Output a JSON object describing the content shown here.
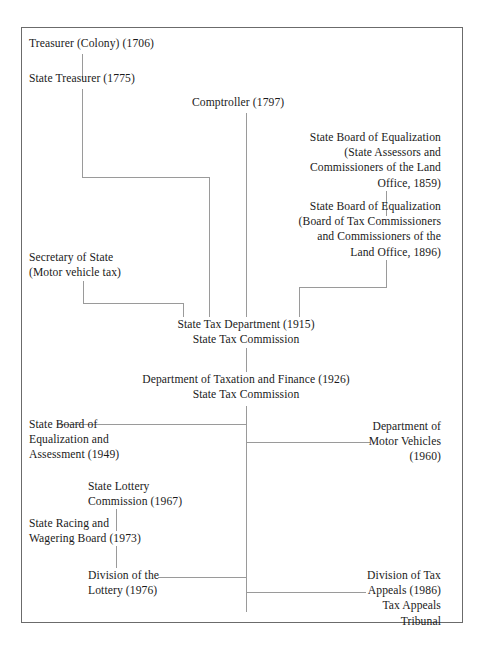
{
  "diagram": {
    "frame_color": "#6b6b6b",
    "line_color": "#9a9a9a",
    "text_color": "#1a1a1a",
    "nodes": [
      {
        "id": "treasurer-colony",
        "text": "Treasurer (Colony) (1706)"
      },
      {
        "id": "state-treasurer",
        "text": "State Treasurer (1775)"
      },
      {
        "id": "comptroller",
        "text": "Comptroller (1797)"
      },
      {
        "id": "sbe-1859",
        "text": "State Board of Equalization\n(State Assessors and\nCommissioners of the Land\nOffice, 1859)"
      },
      {
        "id": "sbe-1896",
        "text": "State Board of Equalization\n(Board of Tax Commissioners\nand Commissioners of the\nLand Office, 1896)"
      },
      {
        "id": "secretary-of-state",
        "text": "Secretary of State\n(Motor vehicle tax)"
      },
      {
        "id": "state-tax-department",
        "text": "State Tax Department (1915)\nState Tax Commission"
      },
      {
        "id": "dept-taxation-finance",
        "text": "Department of Taxation and Finance (1926)\nState Tax Commission"
      },
      {
        "id": "sbe-assessment-1949",
        "text": "State Board of\nEqualization and\nAssessment (1949)"
      },
      {
        "id": "dept-motor-vehicles",
        "text": "Department of\nMotor Vehicles\n(1960)"
      },
      {
        "id": "state-lottery-commission",
        "text": "State Lottery\nCommission (1967)"
      },
      {
        "id": "racing-wagering-board",
        "text": "State Racing and\nWagering Board (1973)"
      },
      {
        "id": "division-of-lottery",
        "text": "Division of the\nLottery (1976)"
      },
      {
        "id": "division-tax-appeals",
        "text": "Division of Tax\nAppeals (1986)\nTax Appeals Tribunal"
      }
    ]
  }
}
